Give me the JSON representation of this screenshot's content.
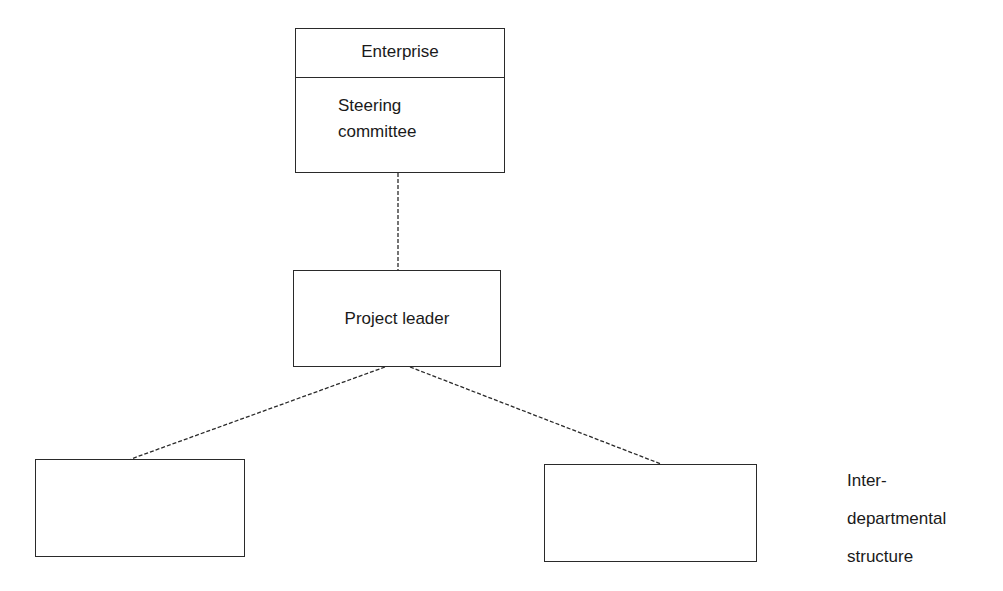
{
  "diagram": {
    "type": "organization-chart",
    "nodes": {
      "enterprise": {
        "header": "Enterprise",
        "body_line1": "Steering",
        "body_line2": "committee"
      },
      "project_leader": {
        "label": "Project leader"
      },
      "left_unit": {
        "label": ""
      },
      "right_unit": {
        "label": ""
      }
    },
    "side_label": {
      "line1": "Inter-",
      "line2": "departmental",
      "line3": "structure"
    },
    "connections": [
      {
        "from": "enterprise",
        "to": "project_leader",
        "style": "dashed"
      },
      {
        "from": "project_leader",
        "to": "left_unit",
        "style": "dashed"
      },
      {
        "from": "project_leader",
        "to": "right_unit",
        "style": "dashed"
      }
    ]
  }
}
